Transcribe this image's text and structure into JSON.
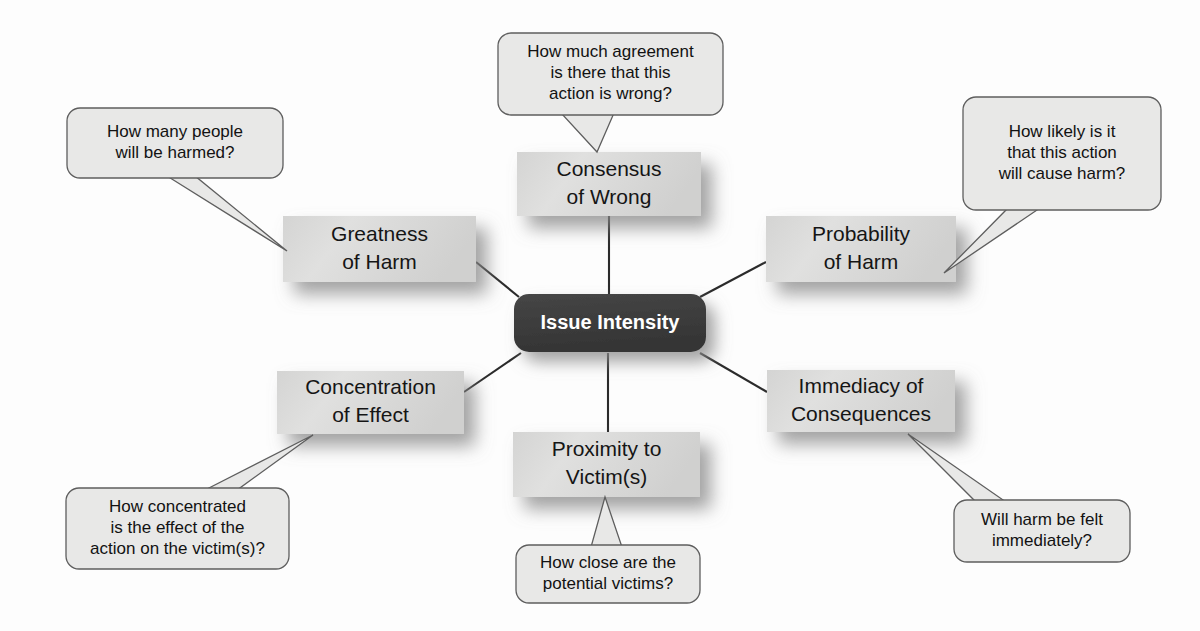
{
  "diagram": {
    "title": "Issue Intensity",
    "center": {
      "label": "Issue Intensity",
      "color": "#3b3b3b",
      "text_color": "#ffffff",
      "x": 610,
      "y": 323,
      "w": 192,
      "h": 58
    },
    "box_color": "#dededd",
    "box_text_color": "#151515",
    "callout_color": "#e8e8e7",
    "callout_border": "#5e5e5e",
    "connector_color": "#2b2b2b",
    "nodes": [
      {
        "id": "consensus-of-wrong",
        "line1": "Consensus",
        "line2": "of Wrong",
        "x": 517,
        "y": 152,
        "w": 184,
        "h": 64,
        "callout": {
          "id": "callout-consensus",
          "lines": [
            "How much agreement",
            "is there that this",
            "action is wrong?"
          ],
          "x": 498,
          "y": 33,
          "w": 225,
          "h": 82,
          "tail": [
            [
              561,
              113
            ],
            [
              614,
              113
            ],
            [
              597,
              152
            ]
          ]
        },
        "connector": [
          [
            609,
            216
          ],
          [
            609,
            294
          ]
        ]
      },
      {
        "id": "greatness-of-harm",
        "line1": "Greatness",
        "line2": "of Harm",
        "x": 283,
        "y": 216,
        "w": 193,
        "h": 66,
        "callout": {
          "id": "callout-greatness",
          "lines": [
            "How many people",
            "will be harmed?"
          ],
          "x": 67,
          "y": 108,
          "w": 216,
          "h": 70,
          "tail": [
            [
              167,
              176
            ],
            [
              195,
              176
            ],
            [
              287,
              251
            ]
          ]
        },
        "connector": [
          [
            476,
            262
          ],
          [
            519,
            297
          ]
        ]
      },
      {
        "id": "probability-of-harm",
        "line1": "Probability",
        "line2": "of Harm",
        "x": 766,
        "y": 216,
        "w": 190,
        "h": 66,
        "callout": {
          "id": "callout-probability",
          "lines": [
            "How likely is it",
            "that this action",
            "will cause harm?"
          ],
          "x": 963,
          "y": 97,
          "w": 198,
          "h": 113,
          "tail": [
            [
              1008,
              208
            ],
            [
              1040,
              208
            ],
            [
              944,
              273
            ]
          ]
        },
        "connector": [
          [
            766,
            262
          ],
          [
            700,
            297
          ]
        ]
      },
      {
        "id": "concentration-of-effect",
        "line1": "Concentration",
        "line2": "of Effect",
        "x": 277,
        "y": 371,
        "w": 187,
        "h": 63,
        "callout": {
          "id": "callout-concentration",
          "lines": [
            "How concentrated",
            "is the effect of the",
            "action on the victim(s)?"
          ],
          "x": 66,
          "y": 488,
          "w": 223,
          "h": 81,
          "tail": [
            [
              205,
              490
            ],
            [
              237,
              490
            ],
            [
              313,
              435
            ]
          ]
        },
        "connector": [
          [
            464,
            392
          ],
          [
            521,
            353
          ]
        ]
      },
      {
        "id": "immediacy-of-consequences",
        "line1": "Immediacy of",
        "line2": "Consequences",
        "x": 767,
        "y": 370,
        "w": 188,
        "h": 62,
        "callout": {
          "id": "callout-immediacy",
          "lines": [
            "Will harm be felt",
            "immediately?"
          ],
          "x": 954,
          "y": 500,
          "w": 176,
          "h": 62,
          "tail": [
            [
              976,
              502
            ],
            [
              1006,
              502
            ],
            [
              908,
              434
            ]
          ]
        },
        "connector": [
          [
            767,
            392
          ],
          [
            700,
            353
          ]
        ]
      },
      {
        "id": "proximity-to-victims",
        "line1": "Proximity to",
        "line2": "Victim(s)",
        "x": 513,
        "y": 432,
        "w": 187,
        "h": 65,
        "callout": {
          "id": "callout-proximity",
          "lines": [
            "How close are the",
            "potential victims?"
          ],
          "x": 516,
          "y": 545,
          "w": 184,
          "h": 58,
          "tail": [
            [
              591,
              547
            ],
            [
              622,
              547
            ],
            [
              605,
              497
            ]
          ]
        },
        "connector": [
          [
            608,
            353
          ],
          [
            608,
            432
          ]
        ]
      }
    ]
  }
}
